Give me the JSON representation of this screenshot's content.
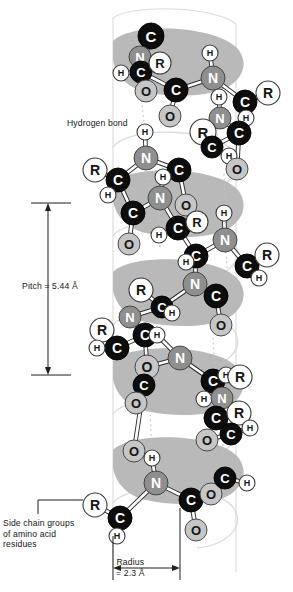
{
  "figure": {
    "type": "molecular-diagram",
    "annotations": {
      "hydrogen_bond": "Hydrogen bond",
      "pitch": "Pitch = 5.44 Å",
      "side_chain_line1": "Side chain groups",
      "side_chain_line2": "of amino acid",
      "side_chain_line3": "residues",
      "radius_line1": "Radius",
      "radius_line2": "= 2.3 Å"
    },
    "measurements": {
      "pitch_value": "5.44",
      "pitch_unit": "Å",
      "radius_value": "2.3",
      "radius_unit": "Å"
    },
    "colors": {
      "carbon": "#0d0d0d",
      "nitrogen": "#8f8f8f",
      "oxygen": "#c6c6c6",
      "hydrogen": "#ffffff",
      "sidechain_r": "#ffffff",
      "ribbon": "#b9b9b9",
      "helix_outline": "#d8d8d8",
      "bond": "#ffffff",
      "bond_stroke": "#2a2a2a",
      "hbond_dotted": "#c2c2c2",
      "text_dark": "#151515"
    },
    "atom_labels": {
      "carbon": "C",
      "nitrogen": "N",
      "oxygen": "O",
      "hydrogen": "H",
      "sidechain": "R"
    },
    "atoms": [
      {
        "id": "a01",
        "el": "C",
        "x": 151,
        "y": 36,
        "r": 13
      },
      {
        "id": "a02",
        "el": "N",
        "x": 140,
        "y": 57,
        "r": 11
      },
      {
        "id": "a03",
        "el": "C",
        "x": 141,
        "y": 72,
        "r": 11
      },
      {
        "id": "a04",
        "el": "R",
        "x": 160,
        "y": 63,
        "r": 11
      },
      {
        "id": "a05",
        "el": "H",
        "x": 121,
        "y": 73,
        "r": 8
      },
      {
        "id": "a06",
        "el": "O",
        "x": 146,
        "y": 91,
        "r": 11
      },
      {
        "id": "a07",
        "el": "C",
        "x": 176,
        "y": 90,
        "r": 12
      },
      {
        "id": "a08",
        "el": "O",
        "x": 170,
        "y": 116,
        "r": 11
      },
      {
        "id": "a09",
        "el": "N",
        "x": 213,
        "y": 78,
        "r": 12
      },
      {
        "id": "a10",
        "el": "H",
        "x": 210,
        "y": 53,
        "r": 8
      },
      {
        "id": "a11",
        "el": "H",
        "x": 219,
        "y": 97,
        "r": 8
      },
      {
        "id": "a12",
        "el": "C",
        "x": 245,
        "y": 102,
        "r": 12
      },
      {
        "id": "a13",
        "el": "R",
        "x": 268,
        "y": 93,
        "r": 12
      },
      {
        "id": "a14",
        "el": "H",
        "x": 246,
        "y": 118,
        "r": 8
      },
      {
        "id": "a15",
        "el": "N",
        "x": 220,
        "y": 118,
        "r": 11
      },
      {
        "id": "a16",
        "el": "C",
        "x": 239,
        "y": 133,
        "r": 12
      },
      {
        "id": "a17",
        "el": "R",
        "x": 203,
        "y": 132,
        "r": 13
      },
      {
        "id": "a18",
        "el": "C",
        "x": 212,
        "y": 147,
        "r": 11
      },
      {
        "id": "a19",
        "el": "H",
        "x": 229,
        "y": 156,
        "r": 8
      },
      {
        "id": "a20",
        "el": "O",
        "x": 237,
        "y": 169,
        "r": 11
      },
      {
        "id": "a21",
        "el": "N",
        "x": 146,
        "y": 158,
        "r": 12
      },
      {
        "id": "a22",
        "el": "H",
        "x": 145,
        "y": 132,
        "r": 8
      },
      {
        "id": "a23",
        "el": "C",
        "x": 118,
        "y": 180,
        "r": 12
      },
      {
        "id": "a24",
        "el": "R",
        "x": 95,
        "y": 170,
        "r": 12
      },
      {
        "id": "a25",
        "el": "H",
        "x": 108,
        "y": 195,
        "r": 8
      },
      {
        "id": "a26",
        "el": "C",
        "x": 179,
        "y": 170,
        "r": 12
      },
      {
        "id": "a27",
        "el": "H",
        "x": 163,
        "y": 177,
        "r": 8
      },
      {
        "id": "a28",
        "el": "N",
        "x": 160,
        "y": 198,
        "r": 12
      },
      {
        "id": "a29",
        "el": "C",
        "x": 133,
        "y": 213,
        "r": 12
      },
      {
        "id": "a30",
        "el": "O",
        "x": 186,
        "y": 205,
        "r": 11
      },
      {
        "id": "a31",
        "el": "C",
        "x": 178,
        "y": 228,
        "r": 12
      },
      {
        "id": "a32",
        "el": "R",
        "x": 197,
        "y": 222,
        "r": 11
      },
      {
        "id": "a33",
        "el": "H",
        "x": 159,
        "y": 235,
        "r": 8
      },
      {
        "id": "a34",
        "el": "O",
        "x": 129,
        "y": 244,
        "r": 11
      },
      {
        "id": "a35",
        "el": "N",
        "x": 225,
        "y": 240,
        "r": 12
      },
      {
        "id": "a36",
        "el": "H",
        "x": 224,
        "y": 213,
        "r": 8
      },
      {
        "id": "a37",
        "el": "C",
        "x": 196,
        "y": 256,
        "r": 12
      },
      {
        "id": "a38",
        "el": "H",
        "x": 186,
        "y": 262,
        "r": 8
      },
      {
        "id": "a39",
        "el": "C",
        "x": 247,
        "y": 266,
        "r": 12
      },
      {
        "id": "a40",
        "el": "R",
        "x": 267,
        "y": 255,
        "r": 12
      },
      {
        "id": "a41",
        "el": "H",
        "x": 259,
        "y": 278,
        "r": 8
      },
      {
        "id": "a42",
        "el": "N",
        "x": 195,
        "y": 284,
        "r": 12
      },
      {
        "id": "a43",
        "el": "C",
        "x": 216,
        "y": 296,
        "r": 12
      },
      {
        "id": "a44",
        "el": "O",
        "x": 221,
        "y": 325,
        "r": 11
      },
      {
        "id": "a45",
        "el": "R",
        "x": 141,
        "y": 290,
        "r": 12
      },
      {
        "id": "a46",
        "el": "C",
        "x": 162,
        "y": 307,
        "r": 11
      },
      {
        "id": "a47",
        "el": "H",
        "x": 172,
        "y": 313,
        "r": 8
      },
      {
        "id": "a48",
        "el": "N",
        "x": 130,
        "y": 317,
        "r": 11
      },
      {
        "id": "a49",
        "el": "C",
        "x": 145,
        "y": 335,
        "r": 12
      },
      {
        "id": "a50",
        "el": "R",
        "x": 102,
        "y": 330,
        "r": 12
      },
      {
        "id": "a51",
        "el": "C",
        "x": 117,
        "y": 348,
        "r": 12
      },
      {
        "id": "a52",
        "el": "H",
        "x": 97,
        "y": 348,
        "r": 8
      },
      {
        "id": "a53",
        "el": "O",
        "x": 147,
        "y": 367,
        "r": 12
      },
      {
        "id": "a54",
        "el": "C",
        "x": 144,
        "y": 385,
        "r": 11
      },
      {
        "id": "a55",
        "el": "O",
        "x": 136,
        "y": 403,
        "r": 11
      },
      {
        "id": "a56",
        "el": "N",
        "x": 180,
        "y": 358,
        "r": 12
      },
      {
        "id": "a57",
        "el": "H",
        "x": 157,
        "y": 335,
        "r": 8
      },
      {
        "id": "a58",
        "el": "C",
        "x": 213,
        "y": 381,
        "r": 12
      },
      {
        "id": "a59",
        "el": "H",
        "x": 226,
        "y": 375,
        "r": 8
      },
      {
        "id": "a60",
        "el": "R",
        "x": 240,
        "y": 377,
        "r": 12
      },
      {
        "id": "a61",
        "el": "H",
        "x": 204,
        "y": 399,
        "r": 8
      },
      {
        "id": "a62",
        "el": "N",
        "x": 222,
        "y": 398,
        "r": 11
      },
      {
        "id": "a63",
        "el": "C",
        "x": 216,
        "y": 418,
        "r": 12
      },
      {
        "id": "a64",
        "el": "R",
        "x": 239,
        "y": 413,
        "r": 12
      },
      {
        "id": "a65",
        "el": "C",
        "x": 231,
        "y": 434,
        "r": 11
      },
      {
        "id": "a66",
        "el": "H",
        "x": 250,
        "y": 428,
        "r": 8
      },
      {
        "id": "a67",
        "el": "O",
        "x": 207,
        "y": 440,
        "r": 11
      },
      {
        "id": "a68",
        "el": "O",
        "x": 134,
        "y": 451,
        "r": 11
      },
      {
        "id": "a69",
        "el": "N",
        "x": 156,
        "y": 483,
        "r": 12
      },
      {
        "id": "a70",
        "el": "H",
        "x": 152,
        "y": 458,
        "r": 8
      },
      {
        "id": "a71",
        "el": "C",
        "x": 120,
        "y": 518,
        "r": 12
      },
      {
        "id": "a72",
        "el": "R",
        "x": 95,
        "y": 505,
        "r": 12
      },
      {
        "id": "a73",
        "el": "H",
        "x": 117,
        "y": 536,
        "r": 8
      },
      {
        "id": "a74",
        "el": "C",
        "x": 191,
        "y": 500,
        "r": 12
      },
      {
        "id": "a75",
        "el": "O",
        "x": 211,
        "y": 494,
        "r": 11
      },
      {
        "id": "a76",
        "el": "C",
        "x": 225,
        "y": 478,
        "r": 11
      },
      {
        "id": "a77",
        "el": "H",
        "x": 247,
        "y": 483,
        "r": 8
      },
      {
        "id": "a78",
        "el": "O",
        "x": 196,
        "y": 530,
        "r": 11
      }
    ]
  }
}
